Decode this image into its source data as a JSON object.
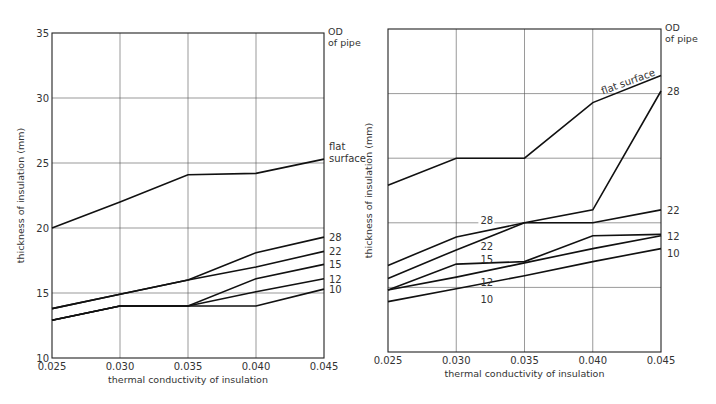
{
  "chart_data": [
    {
      "type": "line",
      "title": "",
      "xlabel": "thermal conductivity of insulation",
      "ylabel": "thickness of insulation (mm)",
      "legend_title": "OD of pipe",
      "x": [
        0.025,
        0.03,
        0.035,
        0.04,
        0.045
      ],
      "x_tick_labels": [
        "0.025",
        "0.030",
        "0.035",
        "0.040",
        "0.045"
      ],
      "y_tick_labels": [
        "10",
        "15",
        "20",
        "25",
        "30",
        "35"
      ],
      "ylim": [
        10,
        35
      ],
      "grid": true,
      "series": [
        {
          "name": "flat surface",
          "label": "flat\nsurface",
          "values": [
            20.0,
            22.0,
            24.1,
            24.2,
            25.3
          ]
        },
        {
          "name": "28",
          "label": "28",
          "values": [
            13.8,
            14.9,
            16.0,
            18.1,
            19.3
          ]
        },
        {
          "name": "22",
          "label": "22",
          "values": [
            13.8,
            14.9,
            16.0,
            17.0,
            18.2
          ]
        },
        {
          "name": "15",
          "label": "15",
          "values": [
            12.9,
            14.0,
            14.0,
            16.1,
            17.2
          ]
        },
        {
          "name": "12",
          "label": "12",
          "values": [
            12.9,
            14.0,
            14.0,
            15.1,
            16.1
          ]
        },
        {
          "name": "10",
          "label": "10",
          "values": [
            12.9,
            14.0,
            14.0,
            14.0,
            15.3
          ]
        }
      ]
    },
    {
      "type": "line",
      "title": "",
      "xlabel": "thermal conductivity of insulation",
      "ylabel": "thickness of insulation (mm)",
      "legend_title": "OD of pipe",
      "x": [
        0.025,
        0.03,
        0.035,
        0.04,
        0.045
      ],
      "x_tick_labels": [
        "0.025",
        "0.030",
        "0.035",
        "0.040",
        "0.045"
      ],
      "y_tick_labels": [],
      "ylim": [
        10,
        35
      ],
      "grid": true,
      "series": [
        {
          "name": "flat surface",
          "label": "flat surface",
          "values": [
            22.9,
            25.0,
            25.0,
            29.3,
            31.4
          ]
        },
        {
          "name": "28",
          "label": "28",
          "values": [
            16.7,
            18.9,
            20.0,
            21.0,
            30.2
          ]
        },
        {
          "name": "22",
          "label": "22",
          "values": [
            15.7,
            17.9,
            20.0,
            20.0,
            21.0
          ]
        },
        {
          "name": "15",
          "label": "15",
          "values": [
            14.8,
            16.8,
            17.0,
            19.0,
            19.1
          ]
        },
        {
          "name": "12",
          "label": "12",
          "values": [
            14.8,
            15.8,
            16.9,
            18.0,
            19.0
          ]
        },
        {
          "name": "10",
          "label": "10",
          "values": [
            13.9,
            14.9,
            15.9,
            17.0,
            18.0
          ]
        }
      ]
    }
  ],
  "labels": {
    "legend_title_line1": "OD",
    "legend_title_line2": "of pipe",
    "flat_line1": "flat",
    "flat_line2": "surface",
    "flat_inline": "flat surface",
    "xlabel": "thermal conductivity of insulation",
    "ylabel": "thickness of insulation (mm)"
  }
}
